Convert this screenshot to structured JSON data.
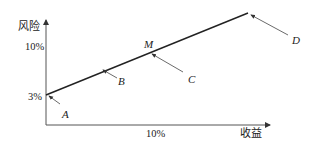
{
  "diagram": {
    "y_axis": {
      "label": "风险",
      "ticks": [
        {
          "label": "10%",
          "y": 47
        },
        {
          "label": "3%",
          "y": 97
        }
      ]
    },
    "x_axis": {
      "label": "收益",
      "ticks": [
        {
          "label": "10%",
          "x": 148
        }
      ]
    },
    "line": {
      "start": [
        46,
        95
      ],
      "end": [
        248,
        13
      ],
      "color": "#222222"
    },
    "points": [
      {
        "name": "A",
        "label_x": 64,
        "label_y": 117,
        "arrow_from": [
          60,
          104
        ],
        "arrow_to": [
          49,
          96
        ]
      },
      {
        "name": "B",
        "label_x": 120,
        "label_y": 84,
        "arrow_from": [
          117,
          78
        ],
        "arrow_to": [
          103,
          70
        ]
      },
      {
        "name": "M",
        "label_x": 145,
        "label_y": 47
      },
      {
        "name": "C",
        "label_x": 189,
        "label_y": 82,
        "arrow_from": [
          183,
          72
        ],
        "arrow_to": [
          152,
          54
        ]
      },
      {
        "name": "D",
        "label_x": 293,
        "label_y": 43,
        "arrow_from": [
          288,
          35
        ],
        "arrow_to": [
          251,
          15
        ]
      }
    ]
  }
}
